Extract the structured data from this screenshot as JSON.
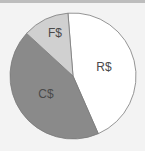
{
  "chart_data": {
    "type": "pie",
    "title": "",
    "start_angle_deg_clockwise_from_top": -4.6,
    "categories": [
      "R$",
      "C$",
      "F$"
    ],
    "values": [
      44.7,
      43.4,
      11.9
    ],
    "colors": [
      "#ffffff",
      "#8a8a8a",
      "#d0d0d0"
    ],
    "labels": [
      "R$",
      "C$",
      "F$"
    ],
    "legend": "none",
    "geometry": {
      "cx": 73,
      "cy": 76,
      "r": 63
    }
  },
  "colors": {
    "background": "#f3f3f3",
    "top_bar": "#bdbdbd",
    "stroke": "#7a7a7a",
    "label": "#4a4a4a"
  }
}
